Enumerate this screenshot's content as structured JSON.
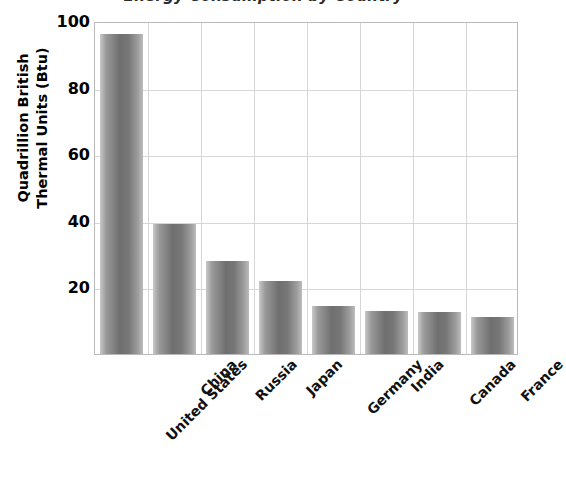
{
  "chart_data": {
    "type": "bar",
    "title": "Energy Consumption by Country",
    "xlabel": "",
    "ylabel": "Quadrillion British Thermal Units (Btu)",
    "ylabel_lines": [
      "Quadrillion British",
      "Thermal Units (Btu)"
    ],
    "categories": [
      "United States",
      "China",
      "Russia",
      "Japan",
      "Germany",
      "India",
      "Canada",
      "France"
    ],
    "values": [
      96,
      39,
      28,
      22,
      14.5,
      13,
      12.5,
      11
    ],
    "ylim": [
      0,
      100
    ],
    "yticks": [
      20,
      40,
      60,
      80,
      100
    ],
    "ytick_labels": [
      "20",
      "40",
      "60",
      "80",
      "100"
    ],
    "grid": true,
    "grid_axes": "both",
    "legend": null,
    "series": [
      {
        "name": "Energy Consumption",
        "values": [
          96,
          39,
          28,
          22,
          14.5,
          13,
          12.5,
          11
        ]
      }
    ],
    "colors": {
      "bar_light": "#c9c9c9",
      "bar_dark": "#6f6f6f",
      "grid": "#d6d6d6",
      "axis": "#b9b9b9",
      "text": "#000000"
    }
  }
}
